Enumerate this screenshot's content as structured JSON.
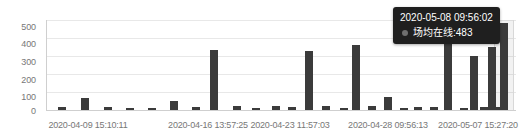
{
  "chart_data": {
    "type": "bar",
    "title": "",
    "xlabel": "",
    "ylabel": "",
    "ylim": [
      0,
      500
    ],
    "grid": true,
    "legend_position": "none",
    "series_name": "场均在线",
    "y_ticks": [
      "0",
      "100",
      "200",
      "300",
      "400",
      "500"
    ],
    "y_tick_values": [
      0,
      100,
      200,
      300,
      400,
      500
    ],
    "x_tick_labels": [
      "2020-04-09 15:10:11",
      "2020-04-16 13:57:25",
      "2020-04-23 11:57:03",
      "2020-04-28 09:56:13",
      "2020-05-07 15:27:20"
    ],
    "x_tick_positions_px": [
      88,
      208,
      290,
      388,
      478
    ],
    "categories": [
      "2020-04-09 15:10:11",
      "b2",
      "b3",
      "b4",
      "b5",
      "b6",
      "b7",
      "b8",
      "b9",
      "2020-04-16 13:57:25",
      "b11",
      "b12",
      "b13",
      "b14",
      "2020-04-23 11:57:03",
      "b16",
      "b17",
      "b18",
      "b19",
      "b20",
      "2020-04-28 09:56:13",
      "b22",
      "b23",
      "b24",
      "b25",
      "b26",
      "2020-05-07 15:27:20",
      "2020-05-08 09:56:02"
    ],
    "values": [
      18,
      65,
      16,
      12,
      12,
      50,
      18,
      335,
      20,
      10,
      20,
      18,
      330,
      20,
      12,
      360,
      20,
      75,
      12,
      18,
      15,
      420,
      12,
      300,
      18,
      350,
      14,
      483
    ],
    "bar_x_px": [
      58,
      81,
      104,
      126,
      148,
      170,
      192,
      210,
      233,
      252,
      272,
      288,
      305,
      322,
      340,
      352,
      368,
      384,
      400,
      414,
      430,
      444,
      460,
      470,
      480,
      488,
      493,
      500
    ],
    "bar_color": "#3b3b3b",
    "axis_color": "#cfcfcf",
    "grid_color": "#e8e8e8",
    "label_color": "#777777"
  },
  "tooltip": {
    "visible": true,
    "timestamp": "2020-05-08 09:56:02",
    "series_label": "场均在线:483",
    "series_name": "场均在线",
    "value": "483",
    "background": "#1f1f1f",
    "text_color": "#ffffff",
    "marker_color": "#6f6f6f"
  },
  "hover": {
    "band_left_px": 494,
    "band_width_px": 18,
    "band_color": "rgba(150,150,150,0.12)"
  }
}
